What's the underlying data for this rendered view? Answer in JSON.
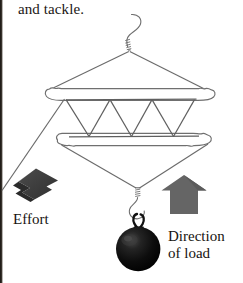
{
  "figure": {
    "name": "block-and-tackle-diagram",
    "caption_text": "and tackle.",
    "effort_label": "Effort",
    "load_label_line1": "Direction",
    "load_label_line2": "of load",
    "icons": {
      "top_hook": "hook-icon",
      "bottom_hook": "hook-icon",
      "load_ball": "ball-weight-icon",
      "effort_arrow": "arrow-down-left-icon",
      "load_arrow": "arrow-up-icon"
    },
    "colors": {
      "rope_line": "#5b5b5b",
      "block_outline": "#6a6a6a",
      "effort_arrow_fill": "#3a3a3a",
      "load_arrow_fill": "#656565",
      "load_ball_fill": "#080808",
      "text": "#171310",
      "page_gutter": "#15120f",
      "background": "#ffffff"
    },
    "geometry": {
      "sheave_count": 4,
      "rope_falls": 5,
      "upper_block_y": 94,
      "lower_block_y": 138,
      "top_hook_y": 18,
      "ball_center": {
        "x": 138,
        "y": 248
      },
      "ball_radius": 22
    }
  }
}
